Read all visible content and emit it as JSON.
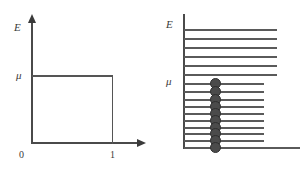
{
  "figure": {
    "width": 305,
    "height": 171,
    "background": "#ffffff",
    "line_color": "#4a4a4a",
    "dot_color": "#4b4b4b"
  },
  "left_panel": {
    "name": "fermi-step-plot",
    "y_axis_label": "E",
    "x_axis_label": "",
    "origin_label": "0",
    "mu_label": "μ",
    "x_tick_label": "1",
    "axis": {
      "origin_x": 32,
      "origin_y": 143,
      "y_top": 18,
      "x_right": 146
    },
    "step": {
      "mu_y": 76,
      "one_x": 112,
      "description": "step function: occupancy equals 1 for E below mu, 0 above"
    }
  },
  "right_panel": {
    "name": "energy-level-ladder",
    "y_axis_label": "E",
    "mu_label": "μ",
    "axis": {
      "vertical_x": 32,
      "y_top": 14,
      "baseline_y": 148,
      "baseline_right": 148
    },
    "dot_column_x": 63,
    "levels": [
      {
        "y": 29,
        "length": 93,
        "occupied": false
      },
      {
        "y": 38,
        "length": 93,
        "occupied": false
      },
      {
        "y": 47,
        "length": 93,
        "occupied": false
      },
      {
        "y": 56,
        "length": 93,
        "occupied": false
      },
      {
        "y": 65,
        "length": 93,
        "occupied": false
      },
      {
        "y": 74,
        "length": 93,
        "occupied": false
      },
      {
        "y": 83,
        "length": 80,
        "occupied": true
      },
      {
        "y": 91,
        "length": 80,
        "occupied": true
      },
      {
        "y": 99,
        "length": 80,
        "occupied": true
      },
      {
        "y": 106,
        "length": 80,
        "occupied": true
      },
      {
        "y": 113,
        "length": 80,
        "occupied": true
      },
      {
        "y": 120,
        "length": 80,
        "occupied": true
      },
      {
        "y": 127,
        "length": 80,
        "occupied": true
      },
      {
        "y": 133,
        "length": 80,
        "occupied": true
      },
      {
        "y": 140,
        "length": 80,
        "occupied": true
      },
      {
        "y": 147,
        "length": 116,
        "occupied": true
      }
    ],
    "mu_level_index": 6,
    "dot_radius": 5.5,
    "occupied_count": 10,
    "empty_count": 6,
    "total_levels": 16
  },
  "chart_data": {
    "type": "line",
    "title": "",
    "panels": [
      {
        "name": "occupancy-step-function",
        "type": "line",
        "xlabel": "",
        "ylabel": "E",
        "xlim": [
          0,
          1.25
        ],
        "ylim": [
          0,
          1.35
        ],
        "xticks": [
          "0",
          "1"
        ],
        "yticks": [
          "0",
          "μ"
        ],
        "grid": false,
        "legend": "none",
        "series": [
          {
            "name": "f(E) at T = 0",
            "x": [
              0,
              1,
              1
            ],
            "y": [
              1,
              1,
              0
            ],
            "note": "vertical riser at occupancy = 1 from E = 0 to E = mu, horizontal top at E = mu"
          }
        ],
        "annotations": [
          {
            "text": "μ",
            "x": 0,
            "y": 1
          },
          {
            "text": "0",
            "x": 0,
            "y": 0
          },
          {
            "text": "1",
            "x": 1,
            "y": 0
          },
          {
            "text": "E",
            "x": 0,
            "y": 1.3
          }
        ]
      },
      {
        "name": "discrete-energy-levels",
        "type": "scatter",
        "xlabel": "",
        "ylabel": "E",
        "grid": false,
        "legend": "none",
        "categories": [
          "level-16",
          "level-15",
          "level-14",
          "level-13",
          "level-12",
          "level-11",
          "level-10",
          "level-9",
          "level-8",
          "level-7",
          "level-6",
          "level-5",
          "level-4",
          "level-3",
          "level-2",
          "level-1"
        ],
        "values": [
          0,
          0,
          0,
          0,
          0,
          0,
          1,
          1,
          1,
          1,
          1,
          1,
          1,
          1,
          1,
          1
        ],
        "annotations": [
          {
            "text": "E",
            "position": "top-left"
          },
          {
            "text": "μ",
            "position": "at-level-10"
          }
        ],
        "note": "filled circles mark occupied states at and below the chemical potential mu; levels above mu are empty"
      }
    ]
  }
}
